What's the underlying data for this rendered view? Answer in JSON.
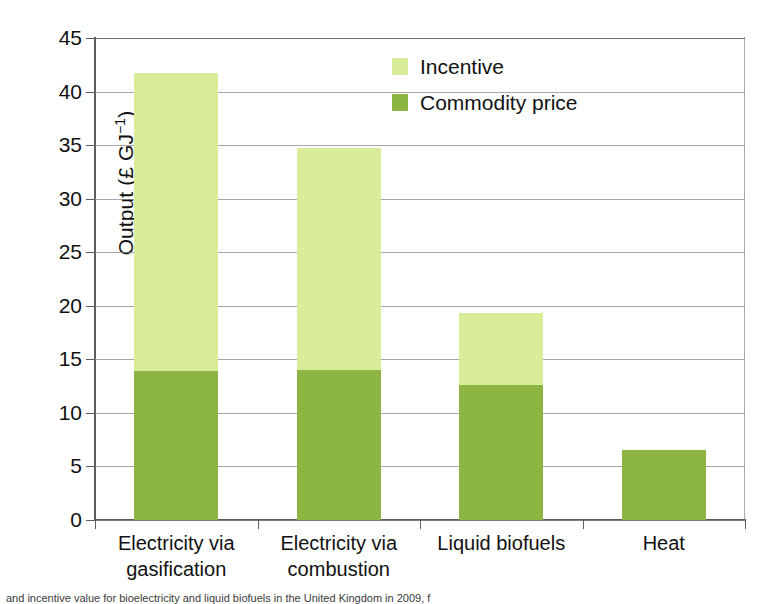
{
  "chart_data": {
    "type": "bar",
    "subtype": "stacked-vertical-bar",
    "title": "",
    "xlabel": "",
    "ylabel": "Output (£ GJ-1)",
    "ylabel_display": "Output (£ GJ",
    "ylabel_superscript": "−1",
    "ylabel_tail": ")",
    "categories": [
      "Electricity via gasification",
      "Electricity via combustion",
      "Liquid biofuels",
      "Heat"
    ],
    "category_lines": [
      [
        "Electricity via",
        "gasification"
      ],
      [
        "Electricity via",
        "combustion"
      ],
      [
        "Liquid biofuels",
        ""
      ],
      [
        "Heat",
        ""
      ]
    ],
    "series": [
      {
        "name": "Commodity price",
        "color": "#8cb544",
        "values": [
          13.9,
          14.0,
          12.6,
          6.5
        ]
      },
      {
        "name": "Incentive",
        "color": "#d9ec9a",
        "values": [
          27.8,
          20.7,
          6.7,
          0.0
        ]
      }
    ],
    "totals": [
      41.7,
      34.7,
      19.3,
      6.5
    ],
    "ylim": [
      0,
      45
    ],
    "yticks": [
      0,
      5,
      10,
      15,
      20,
      25,
      30,
      35,
      40,
      45
    ],
    "ytick_labels": [
      "0",
      "5",
      "10",
      "15",
      "20",
      "25",
      "30",
      "35",
      "40",
      "45"
    ],
    "grid": true,
    "grid_axis": "y",
    "legend_position": "top-center-right",
    "legend": [
      {
        "label": "Incentive",
        "swatch": "incentive",
        "color": "#d9ec9a"
      },
      {
        "label": "Commodity price",
        "swatch": "commodity",
        "color": "#8cb544"
      }
    ]
  },
  "caption": {
    "text": "and incentive value for bioelectricity and liquid biofuels in the United Kingdom in 2009, f"
  },
  "colors": {
    "incentive": "#d9ec9a",
    "commodity_price": "#8cb544",
    "axis": "#5c5c5c",
    "grid": "#8a8a8a",
    "text": "#111111",
    "background": "#ffffff"
  }
}
